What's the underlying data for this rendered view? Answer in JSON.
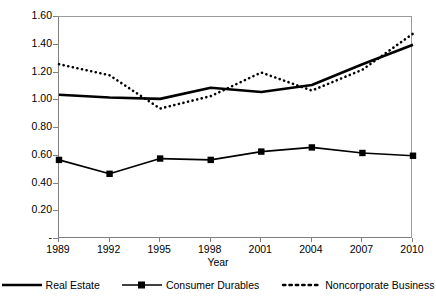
{
  "chart_data": {
    "type": "line",
    "title": "",
    "xlabel": "Year",
    "ylabel": "",
    "categories": [
      "1989",
      "1992",
      "1995",
      "1998",
      "2001",
      "2004",
      "2007",
      "2010"
    ],
    "x": [
      1989,
      1992,
      1995,
      1998,
      2001,
      2004,
      2007,
      2010
    ],
    "ylim": [
      0.0,
      1.6
    ],
    "xlim": [
      1989,
      2010
    ],
    "yticks": [
      "-",
      "0.20",
      "0.40",
      "0.60",
      "0.80",
      "1.00",
      "1.20",
      "1.40",
      "1.60"
    ],
    "ytick_values": [
      0.0,
      0.2,
      0.4,
      0.6,
      0.8,
      1.0,
      1.2,
      1.4,
      1.6
    ],
    "grid": false,
    "legend_position": "bottom",
    "series": [
      {
        "name": "Real Estate",
        "style": "solid",
        "marker": "none",
        "color": "#000000",
        "values": [
          1.04,
          1.02,
          1.01,
          1.09,
          1.06,
          1.11,
          1.26,
          1.4
        ]
      },
      {
        "name": "Consumer Durables",
        "style": "solid",
        "marker": "square",
        "color": "#000000",
        "values": [
          0.57,
          0.47,
          0.58,
          0.57,
          0.63,
          0.66,
          0.62,
          0.6
        ]
      },
      {
        "name": "Noncorporate Business",
        "style": "dotted",
        "marker": "none",
        "color": "#000000",
        "values": [
          1.26,
          1.18,
          0.94,
          1.03,
          1.2,
          1.07,
          1.22,
          1.48
        ]
      }
    ]
  },
  "axis": {
    "x_title": "Year",
    "y_ticks": [
      {
        "label": "1.60"
      },
      {
        "label": "1.40"
      },
      {
        "label": "1.20"
      },
      {
        "label": "1.00"
      },
      {
        "label": "0.80"
      },
      {
        "label": "0.60"
      },
      {
        "label": "0.40"
      },
      {
        "label": "0.20"
      },
      {
        "label": "-"
      }
    ],
    "x_ticks": [
      {
        "label": "1989"
      },
      {
        "label": "1992"
      },
      {
        "label": "1995"
      },
      {
        "label": "1998"
      },
      {
        "label": "2001"
      },
      {
        "label": "2004"
      },
      {
        "label": "2007"
      },
      {
        "label": "2010"
      }
    ]
  },
  "legend": {
    "items": [
      {
        "label": "Real Estate"
      },
      {
        "label": "Consumer Durables"
      },
      {
        "label": "Noncorporate Business"
      }
    ]
  },
  "colors": {
    "ink": "#000000",
    "axis": "#808080",
    "background": "#ffffff"
  }
}
